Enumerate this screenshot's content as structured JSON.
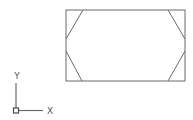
{
  "drawing": {
    "stroke_color": "#6b6b6b",
    "rectangle": {
      "x1": 66,
      "y1": 10,
      "x2": 185,
      "y2": 81
    },
    "chamfers": [
      {
        "name": "top-left",
        "x1": 83,
        "y1": 10,
        "x2": 66,
        "y2": 39
      },
      {
        "name": "bottom-left",
        "x1": 66,
        "y1": 51,
        "x2": 82,
        "y2": 81
      },
      {
        "name": "top-right",
        "x1": 168,
        "y1": 10,
        "x2": 185,
        "y2": 39
      },
      {
        "name": "bottom-right",
        "x1": 185,
        "y1": 51,
        "x2": 168,
        "y2": 81
      }
    ]
  },
  "ucs_icon": {
    "origin": {
      "x": 16,
      "y": 110
    },
    "x_axis_label": "X",
    "y_axis_label": "Y",
    "color": "#6b6b6b"
  }
}
